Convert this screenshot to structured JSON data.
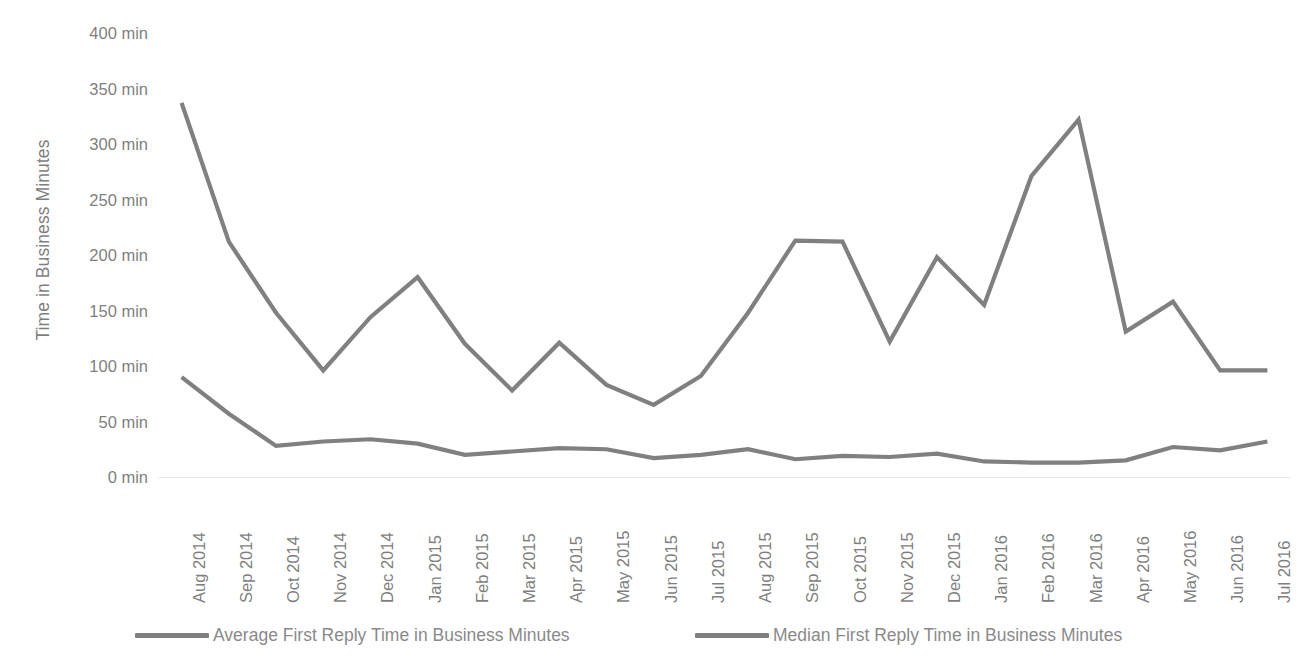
{
  "chart_data": {
    "type": "line",
    "title": "",
    "xlabel": "",
    "ylabel": "Time in Business Minutes",
    "ylim": [
      0,
      400
    ],
    "ytick_step": 50,
    "ytick_labels": [
      "400 min",
      "350 min",
      "300 min",
      "250 min",
      "200 min",
      "150 min",
      "100 min",
      "50 min",
      "0 min"
    ],
    "ytick_values": [
      400,
      350,
      300,
      250,
      200,
      150,
      100,
      50,
      0
    ],
    "grid": false,
    "legend_position": "bottom",
    "line_color": "#808080",
    "text_color": "#7f7f7f",
    "background": "#ffffff",
    "categories": [
      "Aug 2014",
      "Sep 2014",
      "Oct 2014",
      "Nov 2014",
      "Dec 2014",
      "Jan 2015",
      "Feb 2015",
      "Mar 2015",
      "Apr 2015",
      "May 2015",
      "Jun 2015",
      "Jul 2015",
      "Aug 2015",
      "Sep 2015",
      "Oct 2015",
      "Nov 2015",
      "Dec 2015",
      "Jan 2016",
      "Feb 2016",
      "Mar 2016",
      "Apr 2016",
      "May 2016",
      "Jun 2016",
      "Jul 2016"
    ],
    "series": [
      {
        "name": "Average First Reply Time in Business Minutes",
        "color": "#808080",
        "values": [
          337,
          212,
          148,
          96,
          144,
          180,
          120,
          78,
          121,
          83,
          65,
          91,
          148,
          213,
          212,
          122,
          198,
          155,
          271,
          322,
          131,
          158,
          96,
          96
        ]
      },
      {
        "name": "Median First Reply Time in Business Minutes",
        "color": "#808080",
        "values": [
          90,
          57,
          28,
          32,
          34,
          30,
          20,
          23,
          26,
          25,
          17,
          20,
          25,
          16,
          19,
          18,
          21,
          14,
          13,
          13,
          15,
          27,
          24,
          32
        ]
      }
    ]
  },
  "legend": {
    "items": [
      {
        "label": "Average First Reply Time in Business Minutes",
        "swatch": "line-swatch"
      },
      {
        "label": "Median First Reply Time in Business Minutes",
        "swatch": "line-swatch"
      }
    ]
  },
  "axis": {
    "y_title": "Time in Business Minutes"
  }
}
